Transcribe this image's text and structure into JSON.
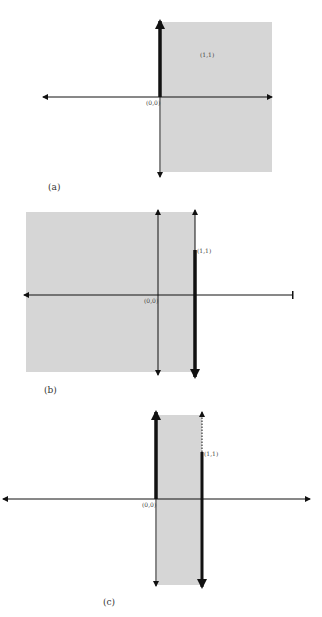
{
  "colors": {
    "shade": "#d6d6d6",
    "line": "#111111",
    "label": "#444444"
  },
  "panels": [
    {
      "id": "a",
      "caption": "(a)",
      "origin_label": "(0,0)",
      "point_label": "(1,1)",
      "description": "Half-plane x >= 0 shaded; positive y-axis drawn bold"
    },
    {
      "id": "b",
      "caption": "(b)",
      "origin_label": "(0,0)",
      "point_label": "(1,1)",
      "description": "Half-plane x <= 1 shaded; line x = 1 bold below (1,1)"
    },
    {
      "id": "c",
      "caption": "(c)",
      "origin_label": "(0,0)",
      "point_label": "(1,1)",
      "description": "Strip 0 <= x <= 1 shaded; y-axis bold above origin, x = 1 bold below (1,1), dotted above"
    }
  ]
}
